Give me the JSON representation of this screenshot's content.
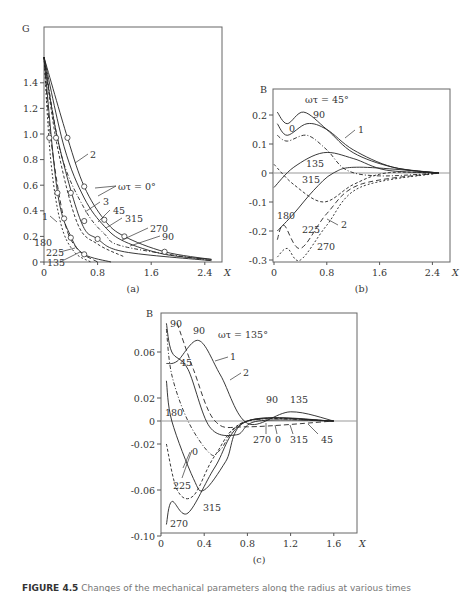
{
  "figure": {
    "caption_label": "FIGURE 4.5",
    "caption_text": "Changes of the mechanical parameters along the radius at various times"
  },
  "chart_data": [
    {
      "id": "a",
      "panel_label": "(a)",
      "type": "line",
      "ylabel": "G",
      "xlabel": "X",
      "xlim": [
        0,
        2.5
      ],
      "ylim": [
        0,
        1.6
      ],
      "xticks": [
        "0",
        "0.8",
        "1.6",
        "2.4"
      ],
      "yticks": [
        "0",
        "0.2",
        "0.4",
        "0.6",
        "0.8",
        "1.0",
        "1.2",
        "1.4"
      ],
      "grid": false,
      "annotations": [
        "2",
        "ωτ = 0°",
        "3",
        "45",
        "315",
        "270",
        "90",
        "1",
        "180",
        "225",
        "135"
      ],
      "series": [
        {
          "name": "ωτ = 0° (upper)",
          "x": [
            0,
            0.35,
            0.6,
            0.9,
            1.2,
            1.8,
            2.5
          ],
          "y": [
            1.6,
            0.97,
            0.59,
            0.33,
            0.2,
            0.08,
            0.02
          ]
        },
        {
          "name": "45",
          "x": [
            0,
            0.3,
            0.6,
            0.9,
            1.2,
            1.8,
            2.5
          ],
          "y": [
            1.6,
            0.9,
            0.5,
            0.28,
            0.16,
            0.06,
            0.02
          ]
        },
        {
          "name": "315",
          "x": [
            0,
            0.25,
            0.6,
            0.9,
            1.2,
            2.5
          ],
          "y": [
            1.6,
            0.85,
            0.42,
            0.22,
            0.12,
            0.01
          ]
        },
        {
          "name": "270",
          "x": [
            0,
            0.2,
            0.55,
            0.8,
            1.2,
            2.5
          ],
          "y": [
            1.6,
            0.97,
            0.32,
            0.18,
            0.08,
            0.01
          ]
        },
        {
          "name": "90",
          "x": [
            0,
            0.2,
            0.5,
            0.8,
            1.2
          ],
          "y": [
            1.6,
            0.9,
            0.3,
            0.14,
            0.04
          ]
        },
        {
          "name": "180",
          "x": [
            0,
            0.2,
            0.4,
            0.6,
            1.0
          ],
          "y": [
            1.6,
            0.55,
            0.2,
            0.06,
            0.0
          ]
        },
        {
          "name": "225",
          "x": [
            0,
            0.1,
            0.3,
            0.5,
            0.8
          ],
          "y": [
            1.6,
            0.97,
            0.33,
            0.1,
            0.0
          ]
        },
        {
          "name": "135",
          "x": [
            0,
            0.1,
            0.25,
            0.45,
            0.7
          ],
          "y": [
            1.6,
            0.8,
            0.3,
            0.08,
            0.0
          ]
        }
      ]
    },
    {
      "id": "b",
      "panel_label": "(b)",
      "type": "line",
      "ylabel": "B",
      "xlabel": "X",
      "xlim": [
        0,
        2.5
      ],
      "ylim": [
        -0.3,
        0.25
      ],
      "xticks": [
        "0",
        "0.8",
        "1.6",
        "2.4"
      ],
      "yticks": [
        "-0.3",
        "-0.2",
        "-0.1",
        "0",
        "0.1",
        "0.2"
      ],
      "grid": false,
      "annotations": [
        "ωτ = 45°",
        "1",
        "90",
        "0",
        "135",
        "315",
        "180",
        "225",
        "2",
        "270"
      ],
      "series": [
        {
          "name": "45",
          "x": [
            0.05,
            0.2,
            0.45,
            0.8,
            1.2,
            1.8,
            2.5
          ],
          "y": [
            0.21,
            0.17,
            0.21,
            0.15,
            0.07,
            0.02,
            0.0
          ]
        },
        {
          "name": "90",
          "x": [
            0.05,
            0.2,
            0.5,
            0.8,
            1.2,
            1.8,
            2.5
          ],
          "y": [
            0.17,
            0.13,
            0.17,
            0.15,
            0.08,
            0.02,
            0.0
          ]
        },
        {
          "name": "0",
          "x": [
            0.05,
            0.2,
            0.5,
            0.8,
            1.1,
            1.6,
            2.5
          ],
          "y": [
            0.13,
            0.11,
            0.13,
            0.08,
            0.01,
            -0.01,
            0.0
          ]
        },
        {
          "name": "135",
          "x": [
            0.0,
            0.3,
            0.75,
            1.2,
            1.7,
            2.5
          ],
          "y": [
            -0.05,
            0.02,
            0.07,
            0.05,
            0.01,
            0.0
          ]
        },
        {
          "name": "315",
          "x": [
            0.0,
            0.3,
            0.75,
            1.2,
            1.7,
            2.5
          ],
          "y": [
            0.03,
            -0.04,
            -0.1,
            -0.04,
            0.0,
            0.0
          ]
        },
        {
          "name": "180",
          "x": [
            0.05,
            0.3,
            0.6,
            0.9,
            1.3,
            2.5
          ],
          "y": [
            -0.2,
            -0.14,
            -0.06,
            0.0,
            0.02,
            0.0
          ]
        },
        {
          "name": "225",
          "x": [
            0.05,
            0.15,
            0.4,
            0.8,
            1.3,
            2.5
          ],
          "y": [
            -0.23,
            -0.18,
            -0.26,
            -0.14,
            -0.04,
            0.0
          ]
        },
        {
          "name": "270",
          "x": [
            0.05,
            0.2,
            0.4,
            0.8,
            1.3,
            2.5
          ],
          "y": [
            -0.29,
            -0.26,
            -0.3,
            -0.18,
            -0.05,
            0.0
          ]
        }
      ]
    },
    {
      "id": "c",
      "panel_label": "(c)",
      "type": "line",
      "ylabel": "B",
      "xlabel": "X",
      "xlim": [
        0,
        1.6
      ],
      "ylim": [
        -0.1,
        0.08
      ],
      "xticks": [
        "0",
        "0.4",
        "0.8",
        "1.2",
        "1.6"
      ],
      "yticks": [
        "-0.10",
        "-0.06",
        "-0.02",
        "0",
        "0.02",
        "0.06"
      ],
      "grid": false,
      "annotations": [
        "90",
        "90",
        "ωτ = 135°",
        "45",
        "1",
        "2",
        "180",
        "90",
        "135",
        "270",
        "0",
        "315",
        "45",
        "0",
        "225",
        "315",
        "270"
      ],
      "series": [
        {
          "name": "135",
          "x": [
            0.05,
            0.15,
            0.35,
            0.55,
            0.8,
            1.2,
            1.6
          ],
          "y": [
            0.05,
            0.052,
            0.07,
            0.04,
            -0.002,
            0.008,
            0.0
          ]
        },
        {
          "name": "90 (solid)",
          "x": [
            0.05,
            0.1,
            0.25,
            0.45,
            0.7,
            0.9,
            1.6
          ],
          "y": [
            0.085,
            0.06,
            0.045,
            -0.005,
            -0.012,
            0.0,
            0.0
          ]
        },
        {
          "name": "45",
          "x": [
            0.05,
            0.1,
            0.25,
            0.45,
            0.55,
            0.8,
            1.6
          ],
          "y": [
            0.08,
            0.04,
            0.0,
            -0.028,
            -0.025,
            0.0,
            0.0
          ]
        },
        {
          "name": "0",
          "x": [
            0.05,
            0.1,
            0.3,
            0.4,
            0.6,
            0.8,
            1.6
          ],
          "y": [
            0.035,
            0.0,
            -0.05,
            -0.06,
            -0.035,
            0.0,
            0.0
          ]
        },
        {
          "name": "315",
          "x": [
            0.05,
            0.15,
            0.3,
            0.5,
            0.8,
            1.6
          ],
          "y": [
            -0.02,
            -0.06,
            -0.065,
            -0.03,
            0.0,
            0.0
          ]
        },
        {
          "name": "270",
          "x": [
            0.05,
            0.1,
            0.25,
            0.5,
            0.8,
            1.6
          ],
          "y": [
            -0.09,
            -0.07,
            -0.08,
            -0.04,
            0.0,
            0.0
          ]
        },
        {
          "name": "90 (dash-dot)",
          "x": [
            0.15,
            0.3,
            0.5,
            0.8,
            1.6
          ],
          "y": [
            0.085,
            0.045,
            0.0,
            -0.005,
            0.0
          ]
        }
      ]
    }
  ]
}
